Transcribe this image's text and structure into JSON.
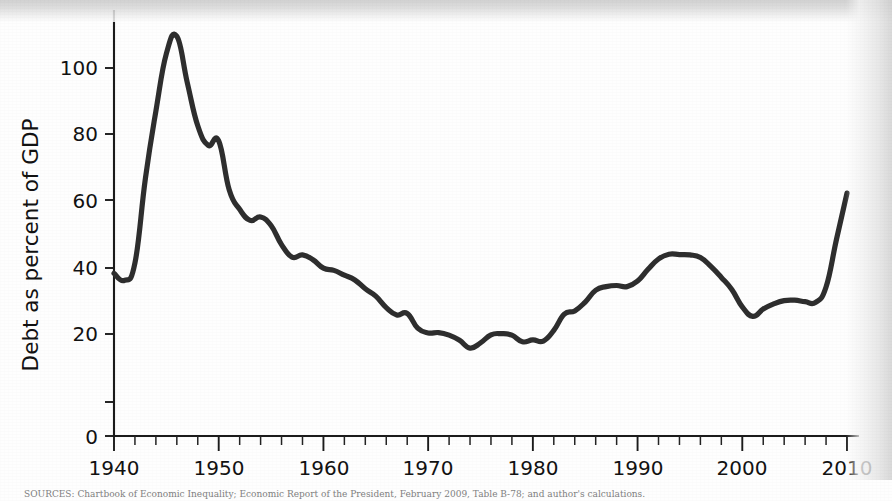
{
  "figure": {
    "background_color": "#fefefe",
    "line_color": "#2e2e2e",
    "text_color": "#121212"
  },
  "source_note": "SOURCES: Chartbook of Economic Inequality; Economic Report of the President, February 2009, Table B-78; and author's calculations.",
  "axes": {
    "y_title": "Debt as percent of GDP",
    "y_ticks": [
      0,
      20,
      40,
      60,
      80,
      100
    ],
    "x_ticks": [
      1940,
      1950,
      1960,
      1970,
      1980,
      1990,
      2000,
      2010
    ]
  },
  "chart_data": {
    "type": "line",
    "title": "",
    "subtitle": "",
    "xlabel": "",
    "ylabel": "Debt as percent of GDP",
    "xlim": [
      1940,
      2010
    ],
    "ylim": [
      0,
      114
    ],
    "grid": false,
    "legend": "none",
    "xticks": [
      1940,
      1950,
      1960,
      1970,
      1980,
      1990,
      2000,
      2010
    ],
    "yticks": [
      0,
      20,
      40,
      60,
      80,
      100
    ],
    "x_minor_tick_interval": 2,
    "series": [
      {
        "name": "Federal debt held by the public as percent of GDP",
        "x": [
          1940,
          1941,
          1942,
          1943,
          1944,
          1945,
          1946,
          1947,
          1948,
          1949,
          1950,
          1951,
          1952,
          1953,
          1954,
          1955,
          1956,
          1957,
          1958,
          1959,
          1960,
          1961,
          1962,
          1963,
          1964,
          1965,
          1966,
          1967,
          1968,
          1969,
          1970,
          1971,
          1972,
          1973,
          1974,
          1975,
          1976,
          1977,
          1978,
          1979,
          1980,
          1981,
          1982,
          1983,
          1984,
          1985,
          1986,
          1987,
          1988,
          1989,
          1990,
          1991,
          1992,
          1993,
          1994,
          1995,
          1996,
          1997,
          1998,
          1999,
          2000,
          2001,
          2002,
          2003,
          2004,
          2005,
          2006,
          2007,
          2008,
          2009,
          2010
        ],
        "y": [
          44.2,
          42.3,
          47.0,
          70.0,
          88.3,
          103.9,
          108.6,
          96.0,
          84.3,
          79.0,
          80.2,
          66.9,
          61.6,
          58.6,
          59.5,
          57.2,
          52.0,
          48.6,
          49.2,
          47.9,
          45.6,
          45.0,
          43.7,
          42.4,
          40.0,
          38.0,
          34.9,
          32.9,
          33.3,
          29.3,
          28.0,
          28.1,
          27.4,
          26.0,
          23.9,
          25.3,
          27.5,
          27.8,
          27.4,
          25.6,
          26.1,
          25.8,
          28.7,
          33.1,
          34.0,
          36.4,
          39.6,
          40.6,
          40.9,
          40.6,
          42.1,
          45.3,
          48.1,
          49.4,
          49.3,
          49.2,
          48.5,
          46.1,
          43.1,
          39.8,
          35.1,
          32.5,
          34.5,
          35.9,
          36.8,
          36.9,
          36.5,
          36.3,
          40.5,
          53.5,
          66.0
        ]
      }
    ]
  }
}
